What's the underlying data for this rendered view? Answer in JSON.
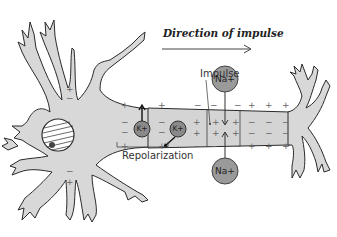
{
  "diagram": {
    "title": "Direction of impulse",
    "labels": {
      "impulse": "Impulse",
      "repolarization": "Repolarization"
    },
    "ions": {
      "na_top": "Na+",
      "na_bottom": "Na+",
      "k_left": "K+",
      "k_right": "K+"
    },
    "colors": {
      "neuron_fill": "#d8d8d8",
      "outline": "#2a2a2a",
      "ion_fill": "#9a9a9a",
      "axon_fill": "#d4d4d4"
    },
    "membrane_charges": {
      "resting_outside": "+",
      "resting_inside": "−",
      "depolarized_inside": "+",
      "depolarized_outside": "−"
    }
  }
}
